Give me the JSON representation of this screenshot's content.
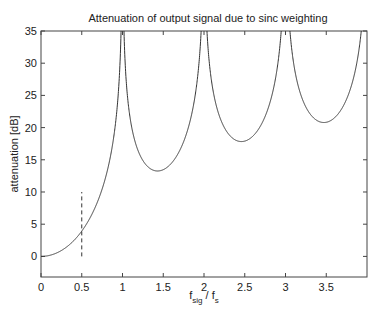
{
  "chart_data": {
    "type": "line",
    "title": "Attenuation of output signal due to sinc weighting",
    "xlabel": "f_sig / f_s",
    "xlabel_parts": {
      "main1": "f",
      "sub1": "sig",
      "sep": " / ",
      "main2": "f",
      "sub2": "s"
    },
    "ylabel": "attenuation [dB]",
    "xlim": [
      0,
      4
    ],
    "ylim": [
      -3.2,
      35
    ],
    "grid": false,
    "legend": null,
    "x_ticks": [
      0,
      0.5,
      1,
      1.5,
      2,
      2.5,
      3,
      3.5
    ],
    "x_tick_labels": [
      "0",
      "0.5",
      "1",
      "1.5",
      "2",
      "2.5",
      "3",
      "3.5"
    ],
    "y_ticks": [
      0,
      5,
      10,
      15,
      20,
      25,
      30,
      35
    ],
    "y_tick_labels": [
      "0",
      "5",
      "10",
      "15",
      "20",
      "25",
      "30",
      "35"
    ],
    "series": [
      {
        "name": "attenuation = -20·log10|sin(πx)/(πx)|",
        "style": "solid",
        "color": "#333333",
        "formula": "-20*log10(abs(sin(pi*x)/(pi*x)))",
        "x": [
          0,
          0.25,
          0.5,
          0.75,
          0.9,
          1.0,
          1.1,
          1.25,
          1.43,
          1.6,
          1.8,
          2.0,
          2.2,
          2.46,
          2.7,
          2.9,
          3.0,
          3.1,
          3.47,
          3.8,
          3.9
        ],
        "values": [
          0,
          0.91,
          3.92,
          9.4,
          15.0,
          35,
          20.1,
          14.9,
          13.3,
          14.4,
          19.4,
          35,
          23.0,
          17.8,
          19.3,
          24.5,
          35,
          25.2,
          20.8,
          24.0,
          28.3
        ]
      },
      {
        "name": "marker at f_sig/f_s = 0.5",
        "style": "dashed",
        "color": "#333333",
        "x": [
          0.5,
          0.5
        ],
        "values": [
          0,
          10
        ]
      }
    ],
    "local_minima": [
      {
        "x": 1.43,
        "y": 13.3
      },
      {
        "x": 2.46,
        "y": 17.8
      },
      {
        "x": 3.47,
        "y": 20.8
      }
    ]
  }
}
